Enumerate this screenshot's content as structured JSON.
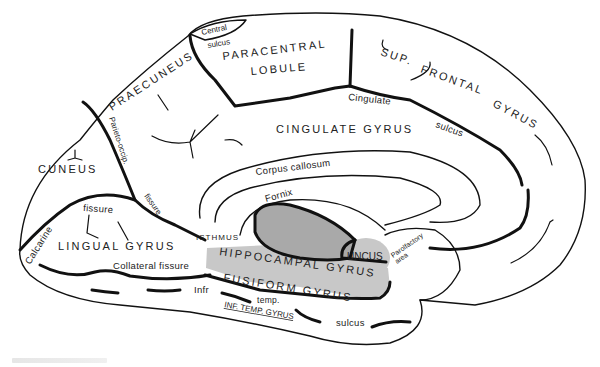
{
  "diagram": {
    "colors": {
      "outline": "#111111",
      "hippocampal_gyrus_fill": "#c8c8c8",
      "thalamus_region_fill": "#a9a9a9",
      "background": "#ffffff",
      "text": "#222222"
    },
    "labels": {
      "central_sulcus_1": "Central",
      "central_sulcus_2": "sulcus",
      "paracentral_1": "PARACENTRAL",
      "paracentral_2": "LOBULE",
      "sup_frontal_1": "SUP.",
      "sup_frontal_2": "FRONTAL",
      "sup_frontal_3": "GYRUS",
      "praecuneus": "PRAECUNEUS",
      "cingulate_sulcus_1": "Cingulate",
      "cingulate_sulcus_2": "sulcus",
      "cingulate_gyrus": "CINGULATE GYRUS",
      "parieto_occip": "Parieto-occip.",
      "fissure_po": "fissure",
      "cuneus": "CUNEUS",
      "corpus_callosum": "Corpus callosum",
      "fornix": "Fornix",
      "calcarine": "Calcarine",
      "calcarine_fissure": "fissure",
      "lingual_gyrus": "LINGUAL GYRUS",
      "isthmus": "ISTHMUS",
      "uncus": "UNCUS",
      "parolfactory_1": "Parolfactory",
      "parolfactory_2": "area",
      "hippocampal_gyrus": "HIPPOCAMPAL GYRUS",
      "collateral_fissure": "Collateral fissure",
      "fusiform_gyrus": "FUSIFORM GYRUS",
      "infr": "Infr",
      "temp": "temp.",
      "sulcus": "sulcus",
      "inf_temp_gyrus": "INF. TEMP. GYRUS"
    }
  }
}
